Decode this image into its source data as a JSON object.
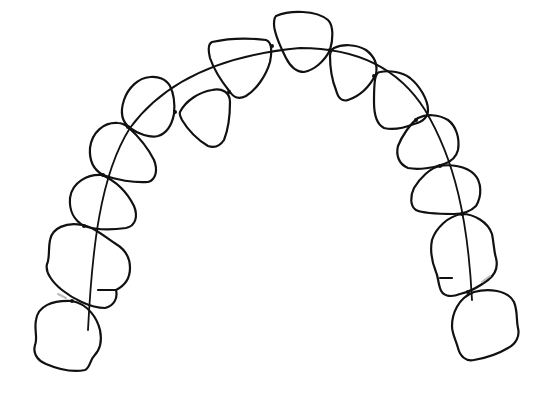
{
  "figure": {
    "title": "Dental arch outline diagram",
    "stroke_color": "#111111",
    "background": "#ffffff",
    "tooth_count": 14
  },
  "diagram": {
    "arch_curve": {
      "label": "arch-line",
      "points": [
        [
          100,
          290
        ],
        [
          110,
          180
        ],
        [
          175,
          90
        ],
        [
          300,
          45
        ],
        [
          420,
          95
        ],
        [
          465,
          200
        ],
        [
          470,
          290
        ]
      ]
    },
    "teeth": [
      {
        "id": "left-molar-2",
        "side": "left",
        "type": "molar"
      },
      {
        "id": "left-molar-1",
        "side": "left",
        "type": "molar"
      },
      {
        "id": "left-premolar-2",
        "side": "left",
        "type": "premolar"
      },
      {
        "id": "left-premolar-1",
        "side": "left",
        "type": "premolar"
      },
      {
        "id": "left-canine",
        "side": "left",
        "type": "canine"
      },
      {
        "id": "left-lateral-incisor",
        "side": "left",
        "type": "incisor"
      },
      {
        "id": "left-central-incisor",
        "side": "left",
        "type": "incisor"
      },
      {
        "id": "right-central-incisor",
        "side": "right",
        "type": "incisor"
      },
      {
        "id": "right-lateral-incisor",
        "side": "right",
        "type": "incisor"
      },
      {
        "id": "right-canine",
        "side": "right",
        "type": "canine"
      },
      {
        "id": "right-premolar-1",
        "side": "right",
        "type": "premolar"
      },
      {
        "id": "right-premolar-2",
        "side": "right",
        "type": "premolar"
      },
      {
        "id": "right-molar-1",
        "side": "right",
        "type": "molar"
      },
      {
        "id": "right-molar-2",
        "side": "right",
        "type": "molar"
      }
    ]
  }
}
